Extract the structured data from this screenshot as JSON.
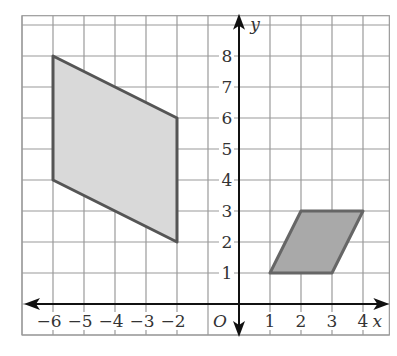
{
  "diagram": {
    "type": "coordinate-grid",
    "axes": {
      "x_label": "x",
      "y_label": "y",
      "origin_label": "O",
      "x_ticks": [
        {
          "value": -6,
          "label": "−6"
        },
        {
          "value": -5,
          "label": "−5"
        },
        {
          "value": -4,
          "label": "−4"
        },
        {
          "value": -3,
          "label": "−3"
        },
        {
          "value": -2,
          "label": "−2"
        },
        {
          "value": 1,
          "label": "1"
        },
        {
          "value": 2,
          "label": "2"
        },
        {
          "value": 3,
          "label": "3"
        },
        {
          "value": 4,
          "label": "4"
        }
      ],
      "y_ticks": [
        {
          "value": 1,
          "label": "1"
        },
        {
          "value": 2,
          "label": "2"
        },
        {
          "value": 3,
          "label": "3"
        },
        {
          "value": 4,
          "label": "4"
        },
        {
          "value": 5,
          "label": "5"
        },
        {
          "value": 6,
          "label": "6"
        },
        {
          "value": 7,
          "label": "7"
        },
        {
          "value": 8,
          "label": "8"
        }
      ]
    },
    "grid": {
      "x_min": -7,
      "x_max": 4.85,
      "y_min": -1,
      "y_max": 9.3,
      "color": "#9a9a9a"
    },
    "shapes": [
      {
        "name": "left-parallelogram",
        "vertices": [
          [
            -6,
            8
          ],
          [
            -2,
            6
          ],
          [
            -2,
            2
          ],
          [
            -6,
            4
          ]
        ],
        "fill": "#d9d9d9",
        "stroke": "#555555"
      },
      {
        "name": "right-parallelogram",
        "vertices": [
          [
            1,
            1
          ],
          [
            2,
            3
          ],
          [
            4,
            3
          ],
          [
            3,
            1
          ]
        ],
        "fill": "#a9a9a9",
        "stroke": "#666666"
      }
    ],
    "colors": {
      "axis": "#111111",
      "text": "#333333",
      "background": "#ffffff"
    }
  }
}
